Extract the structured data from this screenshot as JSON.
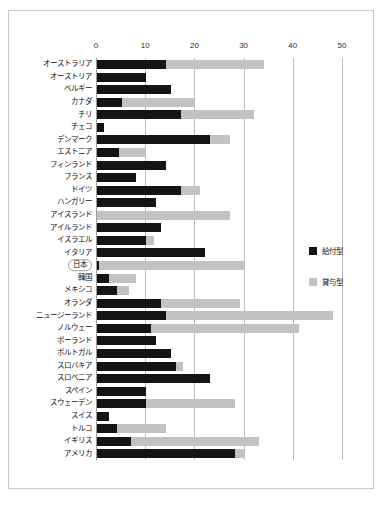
{
  "chart_data": {
    "type": "bar",
    "orientation": "horizontal",
    "stacked": true,
    "title": "",
    "xlabel": "",
    "ylabel": "",
    "xlim": [
      0,
      50
    ],
    "xticks": [
      0,
      10,
      20,
      30,
      40,
      50
    ],
    "xtick_labels": [
      "0",
      "10",
      "20",
      "30",
      "40",
      "50"
    ],
    "grid": "vertical",
    "legend_position": "right",
    "colors": {
      "grant": "#141414",
      "loan": "#c2c2c2",
      "gridline": "#bdbdbd",
      "frame": "#c8c8c8"
    },
    "series": [
      {
        "name": "給付型",
        "key": "grant",
        "color": "#141414"
      },
      {
        "name": "貸与型",
        "key": "loan",
        "color": "#c2c2c2"
      }
    ],
    "highlight_category": "日本",
    "categories": [
      "オーストラリア",
      "オーストリア",
      "ベルギー",
      "カナダ",
      "チリ",
      "チェコ",
      "デンマーク",
      "エストニア",
      "フィンランド",
      "フランス",
      "ドイツ",
      "ハンガリー",
      "アイスランド",
      "アイルランド",
      "イスラエル",
      "イタリア",
      "日本",
      "韓国",
      "メキシコ",
      "オランダ",
      "ニュージーランド",
      "ノルウェー",
      "ポーランド",
      "ポルトガル",
      "スロバキア",
      "スロベニア",
      "スペイン",
      "スウェーデン",
      "スイス",
      "トルコ",
      "イギリス",
      "アメリカ"
    ],
    "rows": [
      {
        "label": "オーストラリア",
        "grant": 14.0,
        "loan": 20.0
      },
      {
        "label": "オーストリア",
        "grant": 10.0,
        "loan": 0.0
      },
      {
        "label": "ベルギー",
        "grant": 15.0,
        "loan": 0.0
      },
      {
        "label": "カナダ",
        "grant": 5.0,
        "loan": 15.0
      },
      {
        "label": "チリ",
        "grant": 17.0,
        "loan": 15.0
      },
      {
        "label": "チェコ",
        "grant": 1.5,
        "loan": 0.0
      },
      {
        "label": "デンマーク",
        "grant": 23.0,
        "loan": 4.0
      },
      {
        "label": "エストニア",
        "grant": 4.5,
        "loan": 5.5
      },
      {
        "label": "フィンランド",
        "grant": 14.0,
        "loan": 0.0
      },
      {
        "label": "フランス",
        "grant": 8.0,
        "loan": 0.0
      },
      {
        "label": "ドイツ",
        "grant": 17.0,
        "loan": 4.0
      },
      {
        "label": "ハンガリー",
        "grant": 12.0,
        "loan": 0.0
      },
      {
        "label": "アイスランド",
        "grant": 0.0,
        "loan": 27.0
      },
      {
        "label": "アイルランド",
        "grant": 13.0,
        "loan": 0.0
      },
      {
        "label": "イスラエル",
        "grant": 10.0,
        "loan": 1.5
      },
      {
        "label": "イタリア",
        "grant": 22.0,
        "loan": 0.0
      },
      {
        "label": "日本",
        "grant": 0.5,
        "loan": 29.5
      },
      {
        "label": "韓国",
        "grant": 2.5,
        "loan": 5.5
      },
      {
        "label": "メキシコ",
        "grant": 4.0,
        "loan": 2.5
      },
      {
        "label": "オランダ",
        "grant": 13.0,
        "loan": 16.0
      },
      {
        "label": "ニュージーランド",
        "grant": 14.0,
        "loan": 34.0
      },
      {
        "label": "ノルウェー",
        "grant": 11.0,
        "loan": 30.0
      },
      {
        "label": "ポーランド",
        "grant": 12.0,
        "loan": 0.0
      },
      {
        "label": "ポルトガル",
        "grant": 15.0,
        "loan": 0.0
      },
      {
        "label": "スロバキア",
        "grant": 16.0,
        "loan": 1.5
      },
      {
        "label": "スロベニア",
        "grant": 23.0,
        "loan": 0.0
      },
      {
        "label": "スペイン",
        "grant": 10.0,
        "loan": 0.0
      },
      {
        "label": "スウェーデン",
        "grant": 10.0,
        "loan": 18.0
      },
      {
        "label": "スイス",
        "grant": 2.5,
        "loan": 0.0
      },
      {
        "label": "トルコ",
        "grant": 4.0,
        "loan": 10.0
      },
      {
        "label": "イギリス",
        "grant": 7.0,
        "loan": 26.0
      },
      {
        "label": "アメリカ",
        "grant": 28.0,
        "loan": 2.0
      }
    ]
  },
  "legend": {
    "items": [
      {
        "label": "給付型",
        "color": "#141414"
      },
      {
        "label": "貸与型",
        "color": "#c2c2c2"
      }
    ]
  },
  "caption": {
    "text": ""
  }
}
